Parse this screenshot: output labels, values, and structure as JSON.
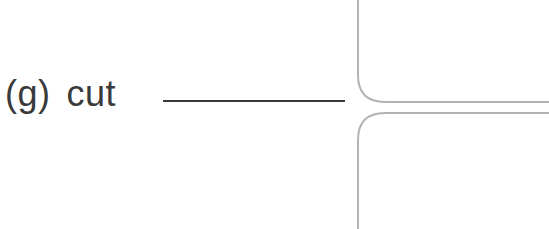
{
  "exercise": {
    "item_letter": "(g)",
    "word": "cut",
    "blank_answer": ""
  },
  "diagram": {
    "type": "road-junction-outline",
    "stroke_color": "#b3b3b3"
  }
}
